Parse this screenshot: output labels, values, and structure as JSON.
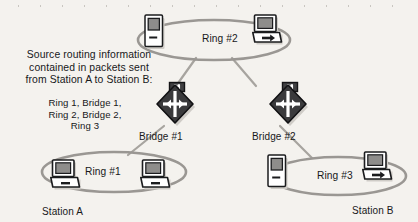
{
  "figure": {
    "type": "source-routing bridged token ring network",
    "caption_line1": "Source routing information",
    "caption_line2": "contained in packets sent",
    "caption_line3": "from Station A to Station B:",
    "route_line1": "Ring 1, Bridge 1,",
    "route_line2": "Ring 2, Bridge 2,",
    "route_line3": "Ring 3"
  },
  "rings": [
    {
      "id": "ring1",
      "label": "Ring #1"
    },
    {
      "id": "ring2",
      "label": "Ring #2"
    },
    {
      "id": "ring3",
      "label": "Ring #3"
    }
  ],
  "bridges": [
    {
      "id": "bridge1",
      "label": "Bridge #1",
      "badge": "SR"
    },
    {
      "id": "bridge2",
      "label": "Bridge #2",
      "badge": "SR"
    }
  ],
  "stations": [
    {
      "id": "station-a",
      "label": "Station A",
      "ring": "Ring #1"
    },
    {
      "id": "station-b",
      "label": "Station B",
      "ring": "Ring #3"
    }
  ],
  "colors": {
    "background": "#f4f2ee",
    "ink": "#17181a",
    "ring_stroke": "#9a9793",
    "link_stroke": "#a7a49f",
    "bridge_fill": "#3a3a3c",
    "screen_fill": "#8e8d8b",
    "device_fill": "#ffffff",
    "shadow": "#cfccc7"
  }
}
